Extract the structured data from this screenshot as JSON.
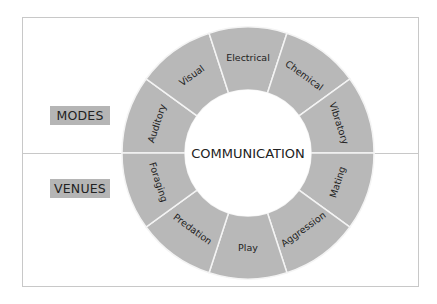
{
  "center_label": "COMMUNICATION",
  "groups": {
    "modes": {
      "label": "MODES"
    },
    "venues": {
      "label": "VENUES"
    }
  },
  "segments": [
    {
      "label": "Auditory",
      "group": "modes"
    },
    {
      "label": "Visual",
      "group": "modes"
    },
    {
      "label": "Electrical",
      "group": "modes"
    },
    {
      "label": "Chemical",
      "group": "modes"
    },
    {
      "label": "Vibratory",
      "group": "modes"
    },
    {
      "label": "Mating",
      "group": "venues"
    },
    {
      "label": "Aggression",
      "group": "venues"
    },
    {
      "label": "Play",
      "group": "venues"
    },
    {
      "label": "Predation",
      "group": "venues"
    },
    {
      "label": "Foraging",
      "group": "venues"
    }
  ],
  "colors": {
    "ring": "#b8b8b8",
    "tag": "#b5b5b5",
    "divider": "#f4f4f4",
    "frame": "#c8c8c8"
  }
}
